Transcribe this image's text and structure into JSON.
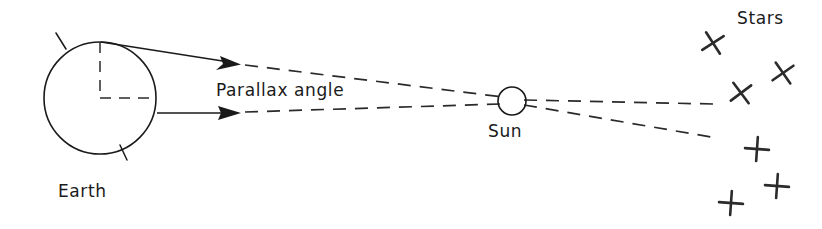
{
  "diagram": {
    "title_text": "Stellar parallax diagram",
    "background_color": "#ffffff",
    "ink_color": "#1a1a1a",
    "labels": {
      "earth": "Earth",
      "sun": "Sun",
      "stars": "Stars",
      "parallax_angle": "Parallax angle"
    },
    "bodies": [
      {
        "name": "earth",
        "label": "Earth",
        "shape": "circle",
        "cx": 100,
        "cy": 98,
        "r": 56,
        "label_x": 58,
        "label_y": 197
      },
      {
        "name": "sun",
        "label": "Sun",
        "shape": "circle",
        "cx": 512,
        "cy": 101,
        "r": 14,
        "label_x": 489,
        "label_y": 136
      }
    ],
    "earth_radii": [
      {
        "name": "vertical-radius",
        "x1": 100,
        "y1": 42,
        "x2": 100,
        "y2": 98
      },
      {
        "name": "horizontal-radius",
        "x1": 100,
        "y1": 98,
        "x2": 156,
        "y2": 98
      }
    ],
    "earth_ticks": [
      {
        "name": "upper-left-tick",
        "x1": 56,
        "y1": 33,
        "x2": 66,
        "y2": 49
      },
      {
        "name": "lower-right-tick",
        "x1": 127,
        "y1": 160,
        "x2": 120,
        "y2": 145
      }
    ],
    "sight_rays": [
      {
        "name": "upper-ray",
        "origin": "earth-top",
        "solid": {
          "x1": 101,
          "y1": 42,
          "x2": 228,
          "y2": 62
        },
        "arrow_tip": {
          "x": 240,
          "y": 64
        },
        "dashed_to_sun": {
          "x1": 243,
          "y1": 64,
          "x2": 505,
          "y2": 98
        },
        "dashed_to_star": {
          "x1": 522,
          "y1": 101,
          "x2": 712,
          "y2": 104
        }
      },
      {
        "name": "lower-ray",
        "origin": "earth-right",
        "solid": {
          "x1": 156,
          "y1": 113,
          "x2": 228,
          "y2": 113
        },
        "arrow_tip": {
          "x": 240,
          "y": 113
        },
        "dashed_to_sun": {
          "x1": 243,
          "y1": 113,
          "x2": 500,
          "y2": 104
        },
        "dashed_to_star": {
          "x1": 523,
          "y1": 105,
          "x2": 710,
          "y2": 137
        }
      }
    ],
    "parallax_label_position": {
      "x": 216,
      "y": 96
    },
    "stars_label_position": {
      "x": 737,
      "y": 24
    },
    "stars": [
      {
        "name": "star-1",
        "cx": 713,
        "cy": 43,
        "size": 13,
        "style": "x"
      },
      {
        "name": "star-2",
        "cx": 783,
        "cy": 73,
        "size": 13,
        "style": "x"
      },
      {
        "name": "star-3",
        "cx": 741,
        "cy": 93,
        "size": 13,
        "style": "x"
      },
      {
        "name": "star-4",
        "cx": 757,
        "cy": 149,
        "size": 13,
        "style": "plus"
      },
      {
        "name": "star-5",
        "cx": 777,
        "cy": 186,
        "size": 13,
        "style": "plus"
      },
      {
        "name": "star-6",
        "cx": 731,
        "cy": 203,
        "size": 13,
        "style": "plus"
      }
    ]
  }
}
